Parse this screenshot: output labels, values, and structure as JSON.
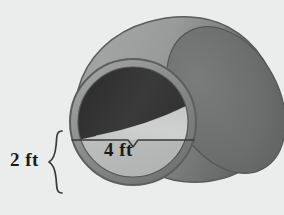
{
  "figure": {
    "kind": "3d-geometry-diagram",
    "background_color": "#ebecec"
  },
  "labels": {
    "diameter": "4 ft",
    "depth": "2 ft"
  },
  "measurements": [
    {
      "name": "diameter",
      "value": 4,
      "unit": "ft",
      "text": "4 ft",
      "placement": "horizontal-chord-across-near-circle"
    },
    {
      "name": "depth",
      "value": 2,
      "unit": "ft",
      "text": "2 ft",
      "placement": "left-of-figure-with-brace"
    }
  ],
  "annotations": {
    "brace_depth": "{",
    "tick_diameter": "v-notch"
  },
  "colors": {
    "background": "#ebecec",
    "outer_surface_light": "#9fa0a0",
    "outer_surface_mid": "#8a8b8b",
    "outer_surface_dark": "#6d6e6e",
    "far_end_dark": "#6a6b6b",
    "rim": "#8c8d8d",
    "rim_outline": "#5f6060",
    "interior_dark": "#343434",
    "liquid_surface": "#c8c9c9",
    "liquid_cross_section": "#b4b5b5",
    "line": "#3a3a3a",
    "text": "#1a1a1a"
  },
  "geometry": {
    "near_circle": {
      "cx": 133,
      "cy": 122,
      "r": 63
    },
    "far_ellipse": {
      "cx": 226,
      "cy": 73,
      "rx": 52,
      "ry": 58
    },
    "chord_line": {
      "x1": 72,
      "y1": 140,
      "x2": 194,
      "y2": 140
    }
  }
}
